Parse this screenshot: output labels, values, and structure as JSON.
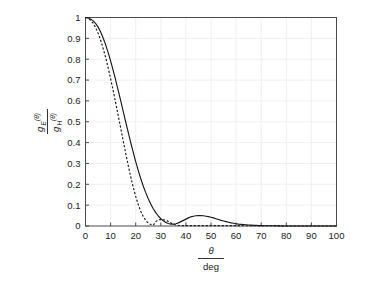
{
  "chart_data": {
    "type": "line",
    "title": "",
    "xlabel_numerator": "θ",
    "xlabel_denominator": "deg",
    "ylabel_numerator_base": "g",
    "ylabel_numerator_sub": "E",
    "ylabel_numerator_sup": "(θ)",
    "ylabel_denominator_base": "g",
    "ylabel_denominator_sub": "H",
    "ylabel_denominator_sup": "(θ)",
    "xlim": [
      0,
      100
    ],
    "ylim": [
      0,
      1
    ],
    "xticks": [
      0,
      10,
      20,
      30,
      40,
      50,
      60,
      70,
      80,
      90,
      100
    ],
    "xtick_labels": [
      "0",
      "10",
      "20",
      "30",
      "40",
      "50",
      "60",
      "70",
      "80",
      "90",
      "100"
    ],
    "yticks": [
      0,
      0.1,
      0.2,
      0.3,
      0.4,
      0.5,
      0.6,
      0.7,
      0.8,
      0.9,
      1
    ],
    "ytick_labels": [
      "0",
      "0.1",
      "0.2",
      "0.3",
      "0.4",
      "0.5",
      "0.6",
      "0.7",
      "0.8",
      "0.9",
      "1"
    ],
    "grid": true,
    "legend": "none",
    "line_color": "#1a1a1a",
    "grid_color": "#ececec",
    "axis_color": "#4a4a4a",
    "series": [
      {
        "name": "g_E(theta) - E-plane pattern",
        "style": "solid",
        "x": [
          0,
          1,
          2,
          3,
          4,
          5,
          6,
          7,
          8,
          9,
          10,
          11,
          12,
          13,
          14,
          15,
          16,
          17,
          18,
          19,
          20,
          21,
          22,
          23,
          24,
          25,
          26,
          27,
          28,
          29,
          30,
          31,
          32,
          33,
          34,
          35,
          36,
          37,
          38,
          39,
          40,
          41,
          42,
          43,
          44,
          45,
          46,
          47,
          48,
          49,
          50,
          51,
          52,
          53,
          54,
          55,
          56,
          57,
          58,
          59,
          60,
          61,
          62,
          63,
          64,
          65,
          66,
          67,
          68,
          69,
          70,
          72,
          75,
          80,
          85,
          90,
          95,
          100
        ],
        "y": [
          1.0,
          0.998,
          0.993,
          0.985,
          0.972,
          0.955,
          0.932,
          0.903,
          0.87,
          0.833,
          0.792,
          0.748,
          0.701,
          0.652,
          0.602,
          0.551,
          0.5,
          0.45,
          0.401,
          0.354,
          0.309,
          0.267,
          0.228,
          0.192,
          0.16,
          0.131,
          0.105,
          0.083,
          0.064,
          0.048,
          0.035,
          0.025,
          0.017,
          0.012,
          0.009,
          0.009,
          0.011,
          0.015,
          0.021,
          0.027,
          0.033,
          0.039,
          0.044,
          0.047,
          0.049,
          0.05,
          0.05,
          0.049,
          0.047,
          0.045,
          0.042,
          0.039,
          0.035,
          0.031,
          0.027,
          0.024,
          0.021,
          0.018,
          0.015,
          0.013,
          0.011,
          0.009,
          0.008,
          0.007,
          0.006,
          0.005,
          0.004,
          0.003,
          0.003,
          0.002,
          0.002,
          0.001,
          0.001,
          0.0,
          0.0,
          0.0,
          0.0,
          0.0
        ]
      },
      {
        "name": "g_H(theta) - H-plane pattern",
        "style": "dashed",
        "x": [
          0,
          1,
          2,
          3,
          4,
          5,
          6,
          7,
          8,
          9,
          10,
          11,
          12,
          13,
          14,
          15,
          16,
          17,
          18,
          19,
          20,
          21,
          22,
          23,
          24,
          25,
          26,
          27,
          28,
          29,
          30,
          31,
          32,
          33,
          34,
          35,
          36,
          37,
          38,
          40,
          42,
          45,
          50,
          55,
          60,
          65,
          70,
          75,
          80,
          85,
          90,
          95,
          100
        ],
        "y": [
          1.0,
          0.997,
          0.988,
          0.973,
          0.952,
          0.925,
          0.892,
          0.853,
          0.809,
          0.76,
          0.707,
          0.651,
          0.592,
          0.532,
          0.471,
          0.41,
          0.35,
          0.292,
          0.237,
          0.187,
          0.142,
          0.103,
          0.071,
          0.046,
          0.027,
          0.014,
          0.007,
          0.004,
          0.021,
          0.03,
          0.031,
          0.03,
          0.028,
          0.022,
          0.015,
          0.009,
          0.005,
          0.003,
          0.002,
          0.002,
          0.002,
          0.002,
          0.002,
          0.002,
          0.002,
          0.001,
          0.001,
          0.001,
          0.0,
          0.0,
          0.0,
          0.0,
          0.0
        ]
      }
    ],
    "annotations": {
      "solid_sidelobe_peak": {
        "x": 46,
        "y": 0.05
      },
      "dashed_sidelobe_peak": {
        "x": 30,
        "y": 0.031
      }
    }
  }
}
